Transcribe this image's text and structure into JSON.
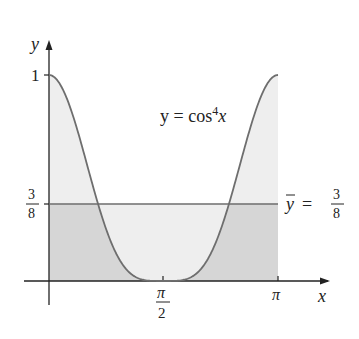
{
  "chart_data": {
    "type": "area",
    "title": "",
    "function": "y = cos^4 x",
    "xlabel": "x",
    "ylabel": "y",
    "xlim": [
      0,
      3.14159
    ],
    "ylim": [
      0,
      1
    ],
    "x_ticks": [
      {
        "value": 1.5708,
        "label_num": "π",
        "label_den": "2"
      },
      {
        "value": 3.14159,
        "label": "π"
      }
    ],
    "y_ticks": [
      {
        "value": 1,
        "label": "1"
      },
      {
        "value": 0.375,
        "label_num": "3",
        "label_den": "8"
      }
    ],
    "series": [
      {
        "name": "y = cos⁴x",
        "x": [
          0,
          0.3927,
          0.7854,
          1.1781,
          1.5708,
          1.9635,
          2.3562,
          2.7489,
          3.14159
        ],
        "values": [
          1,
          0.7286,
          0.25,
          0.0214,
          0,
          0.0214,
          0.25,
          0.7286,
          1
        ]
      },
      {
        "name": "ȳ = 3/8",
        "x": [
          0,
          3.14159
        ],
        "values": [
          0.375,
          0.375
        ]
      }
    ],
    "annotations": [
      {
        "text": "y = cos⁴x",
        "position": "upper right of curve"
      },
      {
        "text": "ȳ = 3/8",
        "position": "right of mean line"
      }
    ],
    "grid": false,
    "legend": "none"
  },
  "labels": {
    "y_axis": "y",
    "x_axis": "x",
    "one": "1",
    "three": "3",
    "eight": "8",
    "pi": "π",
    "two": "2",
    "curve_label_prefix": "y = cos",
    "curve_label_exp": "4",
    "curve_label_suffix": "x",
    "mean_label_y": "y",
    "mean_label_eq": "="
  },
  "colors": {
    "curve": "#6e6e6e",
    "light_fill": "#eeeeee",
    "dark_fill": "#d6d6d6",
    "axis": "#222222"
  }
}
